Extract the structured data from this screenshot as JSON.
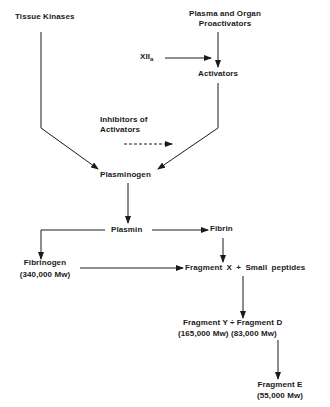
{
  "diagram": {
    "type": "flowchart",
    "title": "",
    "nodes": {
      "tissue_kinases": "Tissue Kinases",
      "plasma_proactivators_line1": "Plasma and Organ",
      "plasma_proactivators_line2": "Proactivators",
      "xiia_main": "XII",
      "xiia_sub": "a",
      "activators": "Activators",
      "inhibitors_line1": "Inhibitors of",
      "inhibitors_line2": "Activators",
      "plasminogen": "Plasminogen",
      "plasmin": "Plasmin",
      "fibrin": "Fibrin",
      "fibrinogen": "Fibrinogen",
      "fibrinogen_mw": "(340,000 Mw)",
      "fragment_x": "Fragment X + Small peptides",
      "fragment_yd": "Fragment Y ÷ Fragment D",
      "fragment_yd_mw": "(165,000 Mw) (83,000 Mw)",
      "fragment_e": "Fragment E",
      "fragment_e_mw": "(55,000 Mw)"
    },
    "edges": [
      {
        "from": "Plasma and Organ Proactivators",
        "to": "Activators",
        "style": "solid"
      },
      {
        "from": "XIIa",
        "to": "Activators",
        "style": "solid"
      },
      {
        "from": "Tissue Kinases",
        "to": "Plasminogen",
        "style": "solid"
      },
      {
        "from": "Activators",
        "to": "Plasminogen",
        "style": "solid"
      },
      {
        "from": "Inhibitors of Activators",
        "to": "Activators-to-Plasminogen pathway",
        "style": "dashed"
      },
      {
        "from": "Plasminogen",
        "to": "Plasmin",
        "style": "solid"
      },
      {
        "from": "Plasmin",
        "to": "Fibrin",
        "style": "solid"
      },
      {
        "from": "Plasmin",
        "to": "Fibrinogen",
        "style": "solid"
      },
      {
        "from": "Fibrinogen",
        "to": "Fragment X + Small peptides",
        "style": "solid"
      },
      {
        "from": "Fibrin",
        "to": "Fragment X + Small peptides",
        "style": "solid"
      },
      {
        "from": "Fragment X",
        "to": "Fragment Y + Fragment D",
        "style": "solid"
      },
      {
        "from": "Fragment Y",
        "to": "Fragment E",
        "style": "solid"
      }
    ],
    "colors": {
      "line": "#1a1a1a",
      "background": "#ffffff"
    }
  }
}
